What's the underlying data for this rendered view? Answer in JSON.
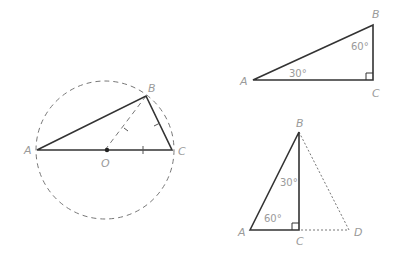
{
  "figures": {
    "circle_figure": {
      "labels": {
        "A": "A",
        "B": "B",
        "C": "C",
        "O": "O"
      }
    },
    "triangle_30_60": {
      "labels": {
        "A": "A",
        "B": "B",
        "C": "C"
      },
      "angles": {
        "at_A": "30°",
        "at_B": "60°"
      }
    },
    "equilateral_split": {
      "labels": {
        "A": "A",
        "B": "B",
        "C": "C",
        "D": "D"
      },
      "angles": {
        "at_A": "60°",
        "at_B": "30°"
      }
    }
  },
  "colors": {
    "line": "#333333",
    "label": "#9a9a9a",
    "dashed": "#777777"
  }
}
